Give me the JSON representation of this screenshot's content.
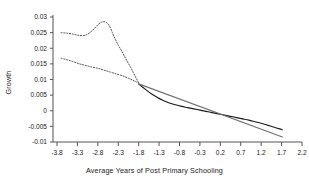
{
  "chart_data": {
    "type": "line",
    "title": "",
    "xlabel": "Average Years of Post Primary Schooling",
    "ylabel": "Growth",
    "xlim": [
      -3.8,
      2.2
    ],
    "ylim": [
      -0.01,
      0.03
    ],
    "grid": false,
    "legend": "none",
    "xticks": [
      "-3.8",
      "-3.3",
      "-2.8",
      "-2.3",
      "-1.8",
      "-1.3",
      "-0.8",
      "-0.3",
      "0.2",
      "0.7",
      "1.2",
      "1.7",
      "2.2"
    ],
    "xtick_values": [
      -3.8,
      -3.3,
      -2.8,
      -2.3,
      -1.8,
      -1.3,
      -0.8,
      -0.3,
      0.2,
      0.7,
      1.2,
      1.7,
      2.2
    ],
    "yticks": [
      "0.03",
      "0.025",
      "0.02",
      "0.015",
      "0.01",
      "0.005",
      "0",
      "-0.005",
      "-0.01"
    ],
    "ytick_values": [
      0.03,
      0.025,
      0.02,
      0.015,
      0.01,
      0.005,
      0,
      -0.005,
      -0.01
    ],
    "series": [
      {
        "name": "Upper confidence band",
        "style": "dotted",
        "color": "#4d4d4d",
        "x": [
          -3.7,
          -3.55,
          -3.4,
          -3.25,
          -3.1,
          -2.95,
          -2.8,
          -2.7,
          -2.6,
          -2.52,
          -2.45,
          -2.38,
          -2.3,
          -2.22,
          -2.15,
          -2.08,
          -2.0,
          -1.93,
          -1.86,
          -1.8
        ],
        "y": [
          0.025,
          0.0248,
          0.0245,
          0.0241,
          0.0242,
          0.0255,
          0.0275,
          0.0284,
          0.0283,
          0.0272,
          0.0252,
          0.0231,
          0.021,
          0.0192,
          0.0175,
          0.0158,
          0.014,
          0.0122,
          0.0104,
          0.009
        ]
      },
      {
        "name": "Lower confidence band",
        "style": "dotted",
        "color": "#4d4d4d",
        "x": [
          -3.7,
          -3.55,
          -3.4,
          -3.25,
          -3.1,
          -2.95,
          -2.8,
          -2.65,
          -2.5,
          -2.35,
          -2.2,
          -2.05,
          -1.9,
          -1.8
        ],
        "y": [
          0.0168,
          0.0163,
          0.0157,
          0.015,
          0.0145,
          0.014,
          0.0136,
          0.013,
          0.0124,
          0.0118,
          0.0112,
          0.0104,
          0.0095,
          0.0088
        ]
      },
      {
        "name": "Nonparametric fit",
        "style": "solid",
        "color": "#1a1a1a",
        "x": [
          -1.8,
          -1.65,
          -1.5,
          -1.35,
          -1.2,
          -1.05,
          -0.9,
          -0.75,
          -0.6,
          -0.45,
          -0.3,
          -0.15,
          0.0,
          0.15,
          0.3,
          0.45,
          0.6,
          0.75,
          0.9,
          1.05,
          1.2,
          1.35,
          1.5,
          1.65,
          1.72
        ],
        "y": [
          0.0086,
          0.007,
          0.0055,
          0.0043,
          0.0033,
          0.0025,
          0.0019,
          0.0014,
          0.001,
          0.0006,
          0.0002,
          -0.0002,
          -0.0006,
          -0.001,
          -0.0014,
          -0.0018,
          -0.0022,
          -0.0026,
          -0.003,
          -0.0035,
          -0.004,
          -0.0046,
          -0.0052,
          -0.0058,
          -0.0061
        ]
      },
      {
        "name": "Linear fit",
        "style": "solid",
        "color": "#707070",
        "x": [
          -1.8,
          1.72
        ],
        "y": [
          0.0086,
          -0.0084
        ]
      }
    ]
  }
}
